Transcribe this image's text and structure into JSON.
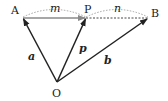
{
  "diagram": {
    "points": {
      "A": {
        "label": "A",
        "x": 23,
        "y": 18
      },
      "P": {
        "label": "P",
        "x": 86,
        "y": 18
      },
      "B": {
        "label": "B",
        "x": 148,
        "y": 18
      },
      "O": {
        "label": "O",
        "x": 57,
        "y": 82
      }
    },
    "ratio_labels": {
      "m": "m",
      "n": "n"
    },
    "vector_labels": {
      "a": "a",
      "p": "p",
      "b": "b"
    },
    "colors": {
      "vector": "#222222",
      "ap_arrow": "#8a8a8a",
      "dashed": "#333333",
      "arc": "#9a9a9a"
    }
  }
}
